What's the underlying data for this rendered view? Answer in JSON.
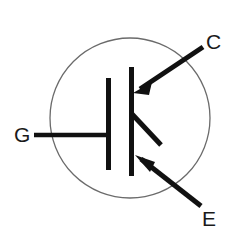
{
  "figure": {
    "kind": "schematic-symbol",
    "component": "IGBT",
    "background_color": "#ffffff",
    "stroke_color": "#111111",
    "envelope_color": "#6b6b6b",
    "label_color": "#1a1a1a"
  },
  "labels": {
    "gate": "G",
    "collector": "C",
    "emitter": "E"
  },
  "geometry": {
    "envelope": {
      "cx": 130,
      "cy": 118,
      "r": 80,
      "stroke_width": 1.3
    },
    "gate_lead": {
      "x1": 34,
      "y1": 135,
      "x2": 110,
      "y2": 135,
      "stroke_width": 4.5
    },
    "gate_plate": {
      "x": 108,
      "y1": 78,
      "y2": 170,
      "stroke_width": 5
    },
    "channel_bar": {
      "x": 131,
      "y1": 67,
      "y2": 176,
      "stroke_width": 5
    },
    "collector_lead": {
      "x1": 203,
      "y1": 47,
      "x2": 135,
      "y2": 92,
      "stroke_width": 5
    },
    "collector_arrow": {
      "tip_x": 133,
      "tip_y": 93,
      "angle_deg": 213
    },
    "base_stub": {
      "x1": 132,
      "y1": 114,
      "x2": 161,
      "y2": 145,
      "stroke_width": 5
    },
    "emitter_lead": {
      "x1": 134,
      "y1": 154,
      "x2": 201,
      "y2": 206,
      "stroke_width": 5
    },
    "emitter_arrow": {
      "tip_x": 137,
      "tip_y": 156,
      "angle_deg": 218
    },
    "label_positions": {
      "gate": {
        "x": 14,
        "y": 135
      },
      "collector": {
        "x": 206,
        "y": 42
      },
      "emitter": {
        "x": 202,
        "y": 219
      }
    }
  }
}
